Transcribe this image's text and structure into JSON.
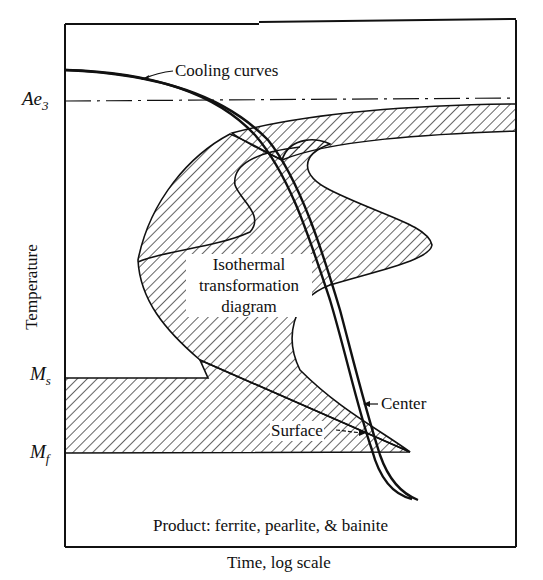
{
  "diagram": {
    "axes": {
      "x_label": "Time, log scale",
      "y_label": "Temperature"
    },
    "temperature_marks": [
      {
        "key": "Ae",
        "sub": "3",
        "y": 101
      },
      {
        "key": "M",
        "sub": "s",
        "y": 378
      },
      {
        "key": "M",
        "sub": "f",
        "y": 453
      }
    ],
    "annotations": {
      "cooling_curves": "Cooling curves",
      "itt_line1": "Isothermal",
      "itt_line2": "transformation",
      "itt_line3": "diagram",
      "center": "Center",
      "surface": "Surface",
      "product": "Product: ferrite, pearlite, & bainite"
    },
    "colors": {
      "ink": "#111111",
      "background": "#ffffff"
    }
  }
}
